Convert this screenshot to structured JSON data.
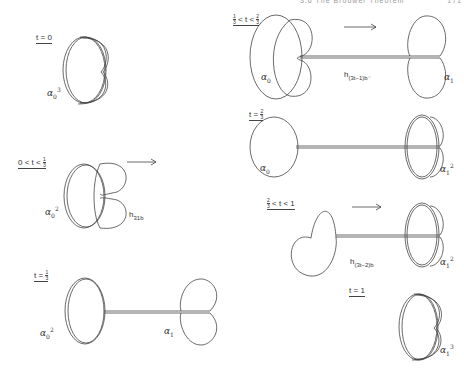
{
  "page": {
    "header_running_title": "3.6  The Brouwer Theorem",
    "header_page_number": "171"
  },
  "figure": {
    "panels": [
      {
        "id": "t0",
        "condition": {
          "left": "t",
          "op": "=",
          "right": "0"
        },
        "loop_label": {
          "base": "α",
          "sub": "0",
          "sup": "3"
        }
      },
      {
        "id": "t0-third",
        "condition": {
          "lower": "0",
          "op1": "<",
          "var": "t",
          "op2": "<",
          "upper_num": "1",
          "upper_den": "3"
        },
        "loop_label": {
          "base": "α",
          "sub": "0",
          "sup": "2"
        },
        "homotopy_label": {
          "base": "h",
          "sub": "31b"
        },
        "arrow": "right-arrow"
      },
      {
        "id": "t-third",
        "condition": {
          "left": "t",
          "op": "=",
          "right_num": "1",
          "right_den": "3"
        },
        "loop_label_left": {
          "base": "α",
          "sub": "0",
          "sup": "2"
        },
        "loop_label_right": {
          "base": "α",
          "sub": "1",
          "sup": ""
        }
      },
      {
        "id": "third-twothirds",
        "condition": {
          "lower_num": "1",
          "lower_den": "3",
          "op1": "<",
          "var": "t",
          "op2": "<",
          "upper_num": "2",
          "upper_den": "3"
        },
        "loop_label_left": {
          "base": "α",
          "sub": "0",
          "sup": ""
        },
        "loop_label_right": {
          "base": "α",
          "sub": "1",
          "sup": ""
        },
        "homotopy_label": {
          "base": "h",
          "sub": "(3t−1)b⁻"
        },
        "arrow": "right-arrow"
      },
      {
        "id": "t-twothirds",
        "condition": {
          "left": "t",
          "op": "=",
          "right_num": "2",
          "right_den": "3"
        },
        "loop_label_left": {
          "base": "α",
          "sub": "0",
          "sup": ""
        },
        "loop_label_right": {
          "base": "α",
          "sub": "1",
          "sup": "2"
        }
      },
      {
        "id": "twothirds-1",
        "condition": {
          "lower_num": "2",
          "lower_den": "3",
          "op1": "<",
          "var": "t",
          "op2": "<",
          "upper": "1"
        },
        "loop_label_right": {
          "base": "α",
          "sub": "1",
          "sup": "2"
        },
        "homotopy_label": {
          "base": "h",
          "sub": "(3t−2)b"
        },
        "arrow": "right-arrow"
      },
      {
        "id": "t1",
        "condition": {
          "left": "t",
          "op": "=",
          "right": "1"
        },
        "loop_label": {
          "base": "α",
          "sub": "1",
          "sup": "3"
        }
      }
    ]
  }
}
